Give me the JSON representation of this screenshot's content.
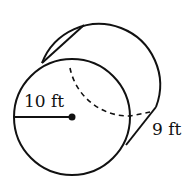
{
  "diagram": {
    "type": "cylinder",
    "labels": {
      "radius": "10 ft",
      "height": "9 ft"
    },
    "colors": {
      "stroke": "#111111",
      "background": "#ffffff"
    }
  }
}
